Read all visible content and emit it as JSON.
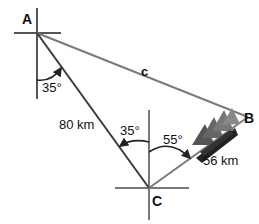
{
  "diagram": {
    "points": {
      "A": {
        "label": "A",
        "x": 37,
        "y": 33
      },
      "B": {
        "label": "B",
        "x": 248,
        "y": 117
      },
      "C": {
        "label": "C",
        "x": 149,
        "y": 188
      }
    },
    "sides": {
      "AC": "80 km",
      "CB": "56 km",
      "AB": "c"
    },
    "angles": {
      "at_A_bearing": "35°",
      "at_C_from_north_to_A": "35°",
      "at_C_from_north_to_B": "55°"
    },
    "icons": [
      "ship-icon"
    ],
    "colors": {
      "line_dark": "#3a3a3a",
      "line_gray": "#7a7a7a"
    }
  }
}
